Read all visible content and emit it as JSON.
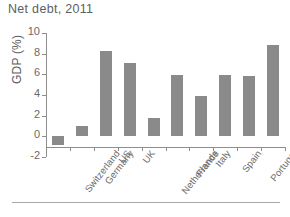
{
  "chart_data": {
    "type": "bar",
    "title": "Net debt, 2011",
    "xlabel": "",
    "ylabel": "GDP (%)",
    "ylim": [
      -2,
      10
    ],
    "yticks": [
      -2,
      0,
      2,
      4,
      6,
      8,
      10
    ],
    "ytick_labels": [
      "-2",
      "0",
      "2",
      "4",
      "6",
      "8",
      "10"
    ],
    "grid": false,
    "legend": null,
    "bar_color": "#8a8a8a",
    "categories": [
      "Switzerland",
      "Germany",
      "US",
      "UK",
      "Netherlands",
      "France",
      "Italy",
      "Spain",
      "Portugal",
      "Greece"
    ],
    "values": [
      -0.8,
      1.0,
      8.3,
      7.1,
      1.8,
      5.9,
      3.9,
      5.9,
      5.8,
      8.8
    ]
  },
  "figure": {
    "axis_color": "#8d8d8d",
    "text_color": "#5e5e5e"
  }
}
